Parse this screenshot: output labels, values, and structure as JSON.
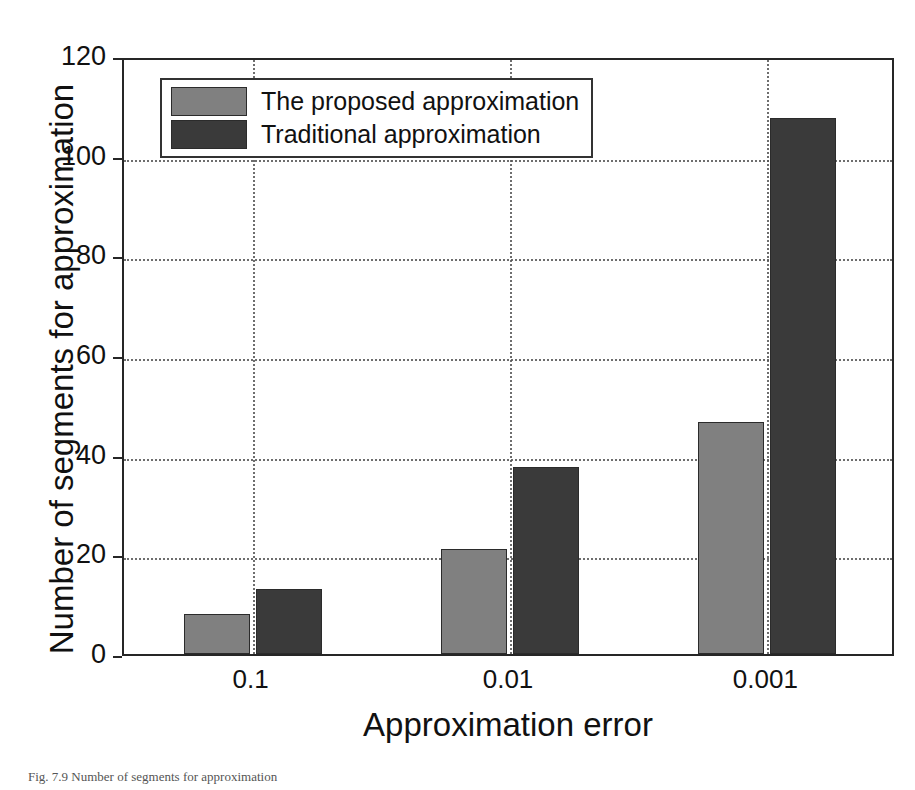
{
  "chart_data": {
    "type": "bar",
    "title": "",
    "categories": [
      "0.1",
      "0.01",
      "0.001"
    ],
    "series": [
      {
        "name": "The proposed approximation",
        "color": "#808080",
        "values": [
          8,
          21,
          46.5
        ]
      },
      {
        "name": "Traditional approximation",
        "color": "#3a3a3a",
        "values": [
          13,
          37.5,
          107.5
        ]
      }
    ],
    "xlabel": "Approximation error",
    "ylabel": "Number of segments for approximation",
    "ylim": [
      0,
      120
    ],
    "yticks": [
      0,
      20,
      40,
      60,
      80,
      100,
      120
    ],
    "ytick_labels": [
      "0",
      "20",
      "40",
      "60",
      "80",
      "100",
      "120"
    ],
    "grid": true,
    "grid_style": "dotted",
    "legend_position": "upper-left",
    "axis_color": "#262626",
    "background": "#ffffff"
  },
  "legend": {
    "entries": [
      {
        "label": "The proposed approximation",
        "swatch": "light"
      },
      {
        "label": "Traditional approximation",
        "swatch": "dark"
      }
    ]
  },
  "caption": {
    "text": "Fig. 7.9  Number of segments for approximation"
  }
}
